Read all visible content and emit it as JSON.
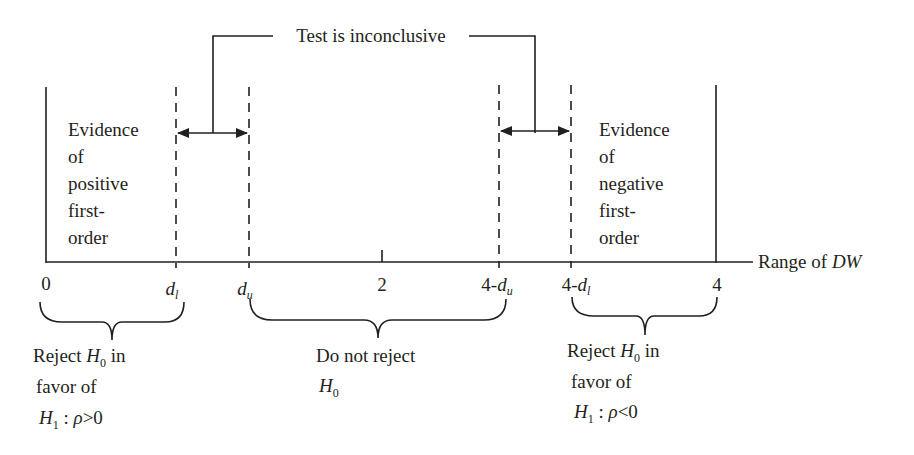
{
  "diagram": {
    "title_label": "Test is inconclusive",
    "axis_label_prefix": "Range of ",
    "axis_label_var": "DW",
    "ticks": {
      "zero": "0",
      "dl": "d",
      "dl_sub": "l",
      "du": "d",
      "du_sub": "u",
      "two": "2",
      "four_minus_du_prefix": "4-",
      "four_minus_du_var": "d",
      "four_minus_du_sub": "u",
      "four_minus_dl_prefix": "4-",
      "four_minus_dl_var": "d",
      "four_minus_dl_sub": "l",
      "four": "4"
    },
    "left_region": {
      "lines": [
        "Evidence",
        "of",
        "positive",
        "first-",
        "order"
      ]
    },
    "right_region": {
      "lines": [
        "Evidence",
        "of",
        "negative",
        "first-",
        "order"
      ]
    },
    "left_decision": {
      "line1_prefix": "Reject ",
      "line1_var": "H",
      "line1_sub": "0",
      "line1_suffix": " in",
      "line2": "favor of",
      "line3_var": "H",
      "line3_sub": "1",
      "line3_colon": " : ",
      "line3_rho": "ρ",
      "line3_rel": ">0"
    },
    "middle_decision": {
      "line1": "Do not reject",
      "line2_var": "H",
      "line2_sub": "0"
    },
    "right_decision": {
      "line1_prefix": "Reject ",
      "line1_var": "H",
      "line1_sub": "0",
      "line1_suffix": " in",
      "line2": "favor of",
      "line3_var": "H",
      "line3_sub": "1",
      "line3_colon": " : ",
      "line3_rho": "ρ",
      "line3_rel": "<0"
    },
    "colors": {
      "ink": "#231f20",
      "background": "#ffffff"
    }
  }
}
